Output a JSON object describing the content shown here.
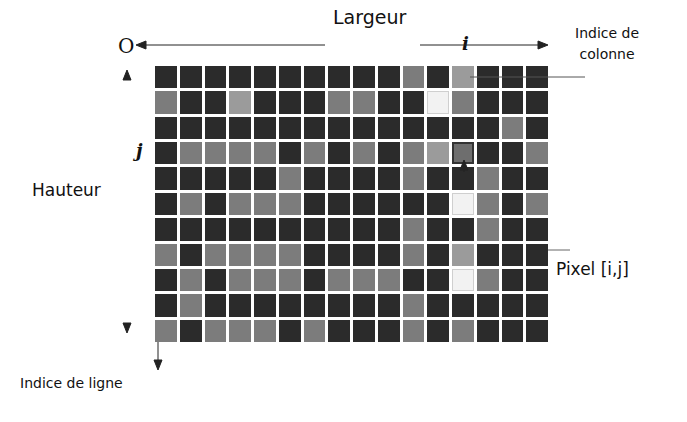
{
  "diagram": {
    "title": "Largeur",
    "origin_label": "O",
    "column_index_symbol": "i",
    "row_index_symbol": "j",
    "column_index_label_line1": "Indice de",
    "column_index_label_line2": "colonne",
    "height_label": "Hauteur",
    "pixel_label": "Pixel [i,j]",
    "row_index_label": "Indice de ligne",
    "grid": {
      "columns": 16,
      "rows": 11,
      "highlighted_pixel": {
        "col": 12,
        "row": 3
      },
      "legend": {
        "D": "#2b2b2b",
        "M": "#7c7c7c",
        "L": "#9b9b9b",
        "W": "#f2f2f2",
        "H": "#6e6e6e"
      },
      "cells": [
        "DDDDDDDDDDMDLDDD",
        "MDDLDDDMMDDWMDDD",
        "DDDDDDDDDDDDDDMD",
        "DMMMMDMDMDMLHDDM",
        "DDDDDMDDDDMDDMDD",
        "DMDMMMDDDDDDWMDM",
        "DDDDDDDDDDMDDMDD",
        "MDMMMMDDDDMDLDDD",
        "DMDMMMDMMMDDWMDD",
        "DMDDDDDDDDMDDDDD",
        "MDMMMDMDDDMDMDDD"
      ]
    }
  }
}
